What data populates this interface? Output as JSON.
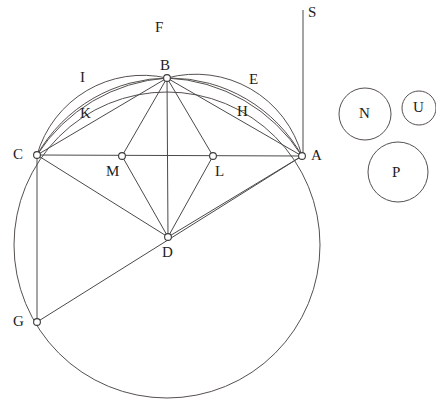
{
  "figure": {
    "stroke_color": "#4a4a4a",
    "arc_color": "#55514f",
    "node_fill": "#ffffff",
    "background": "#ffffff"
  },
  "points": [
    {
      "id": "A",
      "label": "A",
      "x": 302,
      "y": 156,
      "label_x": 311,
      "label_y": 148,
      "marker": true
    },
    {
      "id": "B",
      "label": "B",
      "x": 167,
      "y": 78,
      "label_x": 160,
      "label_y": 58,
      "marker": true
    },
    {
      "id": "C",
      "label": "C",
      "x": 37,
      "y": 155,
      "label_x": 13,
      "label_y": 147,
      "marker": true
    },
    {
      "id": "D",
      "label": "D",
      "x": 168,
      "y": 237,
      "label_x": 162,
      "label_y": 245,
      "marker": true
    },
    {
      "id": "G",
      "label": "G",
      "x": 37,
      "y": 322,
      "label_x": 13,
      "label_y": 314,
      "marker": true
    },
    {
      "id": "L",
      "label": "L",
      "x": 213,
      "y": 156,
      "label_x": 215,
      "label_y": 164,
      "marker": true
    },
    {
      "id": "M",
      "label": "M",
      "x": 122,
      "y": 156,
      "label_x": 106,
      "label_y": 164,
      "marker": true
    }
  ],
  "arc_labels": [
    {
      "id": "F",
      "label": "F",
      "label_x": 155,
      "label_y": 20
    },
    {
      "id": "I",
      "label": "I",
      "label_x": 80,
      "label_y": 70
    },
    {
      "id": "K",
      "label": "K",
      "label_x": 80,
      "label_y": 106
    },
    {
      "id": "E",
      "label": "E",
      "label_x": 249,
      "label_y": 72
    },
    {
      "id": "H",
      "label": "H",
      "label_x": 237,
      "label_y": 104
    },
    {
      "id": "S",
      "label": "S",
      "label_x": 308,
      "label_y": 5
    }
  ],
  "small_circles": [
    {
      "id": "N",
      "label": "N",
      "cx": 365,
      "cy": 114,
      "r": 26,
      "label_x": 359,
      "label_y": 106
    },
    {
      "id": "U",
      "label": "U",
      "cx": 419,
      "cy": 108,
      "r": 17,
      "label_x": 413,
      "label_y": 100
    },
    {
      "id": "P",
      "label": "P",
      "cx": 398,
      "cy": 172,
      "r": 30,
      "label_x": 392,
      "label_y": 165
    }
  ],
  "main_circle": {
    "cx": 167,
    "cy": 245,
    "r": 153
  },
  "vertical_line_s": {
    "x": 303,
    "y_top": 10,
    "y_bottom": 156
  },
  "segments": [
    {
      "from": "C",
      "to": "A"
    },
    {
      "from": "C",
      "to": "B"
    },
    {
      "from": "B",
      "to": "A"
    },
    {
      "from": "C",
      "to": "D"
    },
    {
      "from": "D",
      "to": "A"
    },
    {
      "from": "B",
      "to": "D"
    },
    {
      "from": "B",
      "to": "M"
    },
    {
      "from": "B",
      "to": "L"
    },
    {
      "from": "M",
      "to": "D"
    },
    {
      "from": "L",
      "to": "D"
    },
    {
      "from": "C",
      "to": "G"
    },
    {
      "from": "G",
      "to": "A"
    }
  ]
}
